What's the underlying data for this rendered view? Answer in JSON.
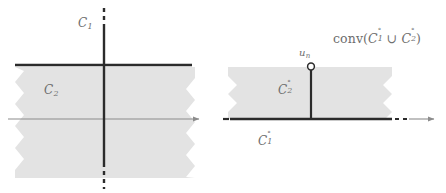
{
  "figure": {
    "type": "geometry-diagram",
    "colors": {
      "shading": "#e3e3e3",
      "bold_line": "#2b2b2b",
      "thin_axis": "#8c8c8c",
      "label_text": "#6d6d6d",
      "background": "#ffffff"
    }
  },
  "left_panel": {
    "name": "panel-left",
    "labels": {
      "c1": {
        "base": "C",
        "sub": "1",
        "x": 78,
        "y": 17
      },
      "c2": {
        "base": "C",
        "sub": "2",
        "x": 44,
        "y": 84
      }
    },
    "vertical_line": {
      "x": 104,
      "solid_top": 25,
      "solid_bottom": 163,
      "dash_top": 8,
      "dash_bottom": 188
    },
    "bold_horizontal": {
      "y": 65,
      "x1": 15,
      "x2": 192
    },
    "shaded_region": {
      "x1": 15,
      "x2": 195,
      "y1": 67,
      "y2": 178
    },
    "axis_arrow": {
      "y": 119,
      "x1": 8,
      "x2": 201
    }
  },
  "right_panel": {
    "name": "panel-right",
    "labels": {
      "conv": {
        "prefix": "conv(",
        "a_base": "C",
        "a_sub": "1",
        "a_circ": "°",
        "union": " ∪ ",
        "b_base": "C",
        "b_sub": "2",
        "b_circ": "°",
        "suffix": ")",
        "x": 333,
        "y": 30
      },
      "u_n": {
        "base": "u",
        "sub": "n",
        "x": 299,
        "y": 48
      },
      "c2_polar": {
        "base": "C",
        "sub": "2",
        "circ": "°",
        "x": 278,
        "y": 82
      },
      "c1_polar": {
        "base": "C",
        "sub": "1",
        "circ": "°",
        "x": 258,
        "y": 133
      }
    },
    "point_un": {
      "cx": 311,
      "cy": 67,
      "r": 3.4,
      "style": "open-circle"
    },
    "stem": {
      "x": 311,
      "y1": 70,
      "y2": 119
    },
    "shaded_region": {
      "x1": 228,
      "x2": 392,
      "y1": 67,
      "y2": 119
    },
    "bold_horizontal": {
      "y": 119,
      "x1": 230,
      "x2": 392
    },
    "dashed_segment": {
      "y": 119,
      "x1": 396,
      "x2": 411
    },
    "axis_arrow": {
      "y": 119,
      "x1": 411,
      "x2": 436
    },
    "left_dash": {
      "y": 119,
      "x1": 223,
      "x2": 229
    }
  }
}
